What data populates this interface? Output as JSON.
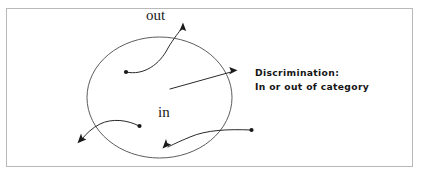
{
  "figure": {
    "type": "concept-diagram",
    "frame": {
      "border_color": "#b9b9b9",
      "background_color": "#ffffff"
    },
    "region": {
      "shape": "ellipse",
      "stroke_color": "#4a4a4a",
      "inside_label": "in",
      "outside_label": "out"
    },
    "annotation": {
      "line1": "Discrimination:",
      "line2": "In or out of category",
      "color": "#151515"
    },
    "arrows": [
      {
        "id": "inside-to-outside-top",
        "description": "curved arrow from a point inside the category exiting through the top",
        "start": "inside",
        "end": "outside",
        "has_start_dot": true,
        "has_arrowhead": true
      },
      {
        "id": "inside-to-outside-right",
        "description": "straight arrow from inside the category crossing the right boundary",
        "start": "inside",
        "end": "outside",
        "has_start_dot": false,
        "has_arrowhead": true
      },
      {
        "id": "inside-to-outside-left",
        "description": "curved arrow from a point inside the category exiting through the lower left",
        "start": "inside",
        "end": "outside",
        "has_start_dot": true,
        "has_arrowhead": true
      },
      {
        "id": "outside-to-inside-bottom",
        "description": "curved arrow from a point outside the category entering through the lower right",
        "start": "outside",
        "end": "inside",
        "has_start_dot": true,
        "has_arrowhead": true
      }
    ]
  }
}
